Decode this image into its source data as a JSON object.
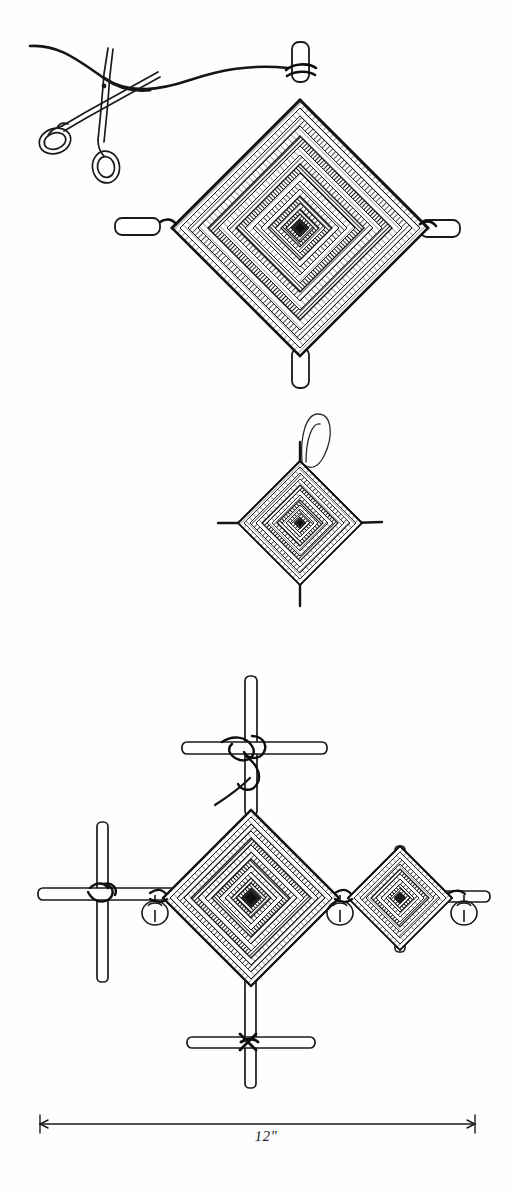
{
  "page": {
    "kind": "hand-drawn-craft-illustration",
    "background_color": "#fefefe",
    "ink_color": "#1a1a1a",
    "width": 514,
    "height": 1193
  },
  "dimension": {
    "label": "12\"",
    "line_y": 1124,
    "x_start": 40,
    "x_end": 475
  },
  "figures": [
    {
      "id": "figure-top",
      "name": "large-ojo-with-scissors",
      "caption": "",
      "ojo": {
        "center_x": 300,
        "center_y": 228,
        "half_diagonal": 128,
        "bands": 17,
        "stick_ends": [
          "top",
          "right",
          "bottom",
          "left"
        ]
      },
      "scissors": {
        "name": "scissors-cutting-yarn",
        "pivot_x": 100,
        "pivot_y": 95
      },
      "yarn_tail": {
        "name": "yarn-thread",
        "from_x": 30,
        "from_y": 46,
        "to_x": 288,
        "to_y": 68
      }
    },
    {
      "id": "figure-middle",
      "name": "small-ojo-with-hanging-loop",
      "caption": "",
      "ojo": {
        "center_x": 300,
        "center_y": 523,
        "half_diagonal": 62,
        "bands": 13,
        "stick_ends": [
          "top",
          "right",
          "bottom",
          "left"
        ]
      },
      "loop": {
        "name": "hanging-loop",
        "center_x": 318,
        "center_y": 440,
        "radius_x": 14,
        "radius_y": 22
      }
    },
    {
      "id": "figure-bottom",
      "name": "mobile-assembly",
      "caption": "",
      "crosses": [
        {
          "name": "cross-top",
          "x": 252,
          "y": 753,
          "arm_h": 75,
          "arm_v": 88
        },
        {
          "name": "cross-left",
          "x": 103,
          "y": 898,
          "arm_h": 70,
          "arm_v": 78
        },
        {
          "name": "cross-bottom",
          "x": 251,
          "y": 1046,
          "arm_h": 68,
          "arm_v": 66
        }
      ],
      "ojos": [
        {
          "name": "ojo-large-center",
          "center_x": 251,
          "center_y": 898,
          "half_diagonal": 88,
          "bands": 15
        },
        {
          "name": "ojo-small-right",
          "center_x": 400,
          "center_y": 898,
          "half_diagonal": 52,
          "bands": 11
        }
      ],
      "bells": [
        {
          "name": "bell-left",
          "x": 155,
          "y": 905
        },
        {
          "name": "bell-middle",
          "x": 340,
          "y": 905
        },
        {
          "name": "bell-right",
          "x": 464,
          "y": 905
        }
      ],
      "yarn_tail": {
        "name": "yarn-thread-tail",
        "from_x": 215,
        "from_y": 805,
        "to_x": 265,
        "to_y": 762
      }
    }
  ]
}
